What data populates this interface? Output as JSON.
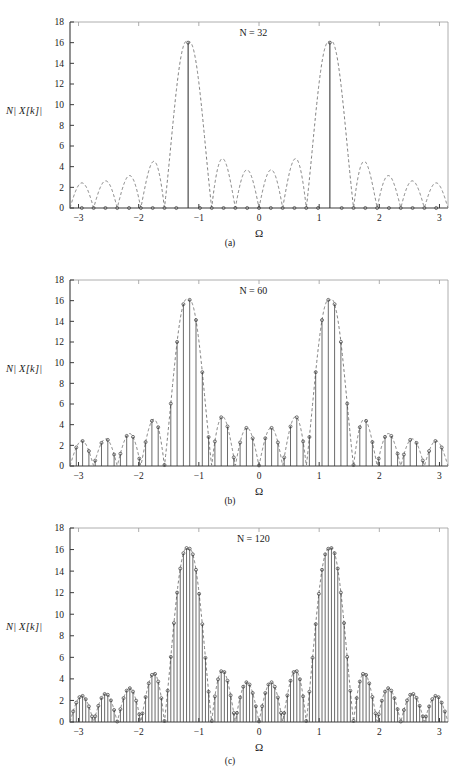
{
  "figure": {
    "panels": [
      {
        "id": "a",
        "caption": "(a)",
        "title": "N = 32",
        "ylabel": "N| X[k]|",
        "xlabel": "Ω",
        "N": 32
      },
      {
        "id": "b",
        "caption": "(b)",
        "title": "N = 60",
        "ylabel": "N| X[k]|",
        "xlabel": "Ω",
        "N": 60
      },
      {
        "id": "c",
        "caption": "(c)",
        "title": "N = 120",
        "ylabel": "N| X[k]|",
        "xlabel": "Ω",
        "N": 120
      }
    ]
  },
  "chart_data": [
    {
      "type": "line",
      "panel": "a",
      "title": "N = 32",
      "xlabel": "Ω",
      "ylabel": "N| X[k]|",
      "xlim": [
        -3.14159,
        3.14159
      ],
      "ylim": [
        0,
        18
      ],
      "xticks": [
        -3,
        -2,
        -1,
        0,
        1,
        2,
        3
      ],
      "yticks": [
        0,
        2,
        4,
        6,
        8,
        10,
        12,
        14,
        16,
        18
      ],
      "grid": false,
      "legend": "none",
      "annotations": [
        "N = 32"
      ],
      "series": [
        {
          "name": "DTFT envelope (dashed)",
          "style": "dashed",
          "description": "Magnitude of the DTFT of a 16-sample two-tone record, |sin(16Ω/2)/sin(Ω/2)| style Dirichlet kernels centred at Ω = ±1.18, mainlobe peak 16, sidelobe peaks near 3.8, 2.5, 1.9, 1.5",
          "peak_value": 16,
          "peak_x": [
            -1.18,
            1.18
          ],
          "first_sidelobe": 3.8
        },
        {
          "name": "DFT samples (stems with circle markers)",
          "style": "stem",
          "marker": "circle",
          "n_points": 32,
          "description": "32-point DFT; bins land exactly on the mainlobe peak and on nulls, so only two non-zero stems of height 16 appear at Ω = ±1.18 and all other bins are 0",
          "nonzero_samples": [
            {
              "x": -1.178,
              "y": 16.0
            },
            {
              "x": 1.178,
              "y": 16.0
            }
          ],
          "zero_samples_count": 30
        }
      ]
    },
    {
      "type": "line",
      "panel": "b",
      "title": "N = 60",
      "xlabel": "Ω",
      "ylabel": "N| X[k]|",
      "xlim": [
        -3.14159,
        3.14159
      ],
      "ylim": [
        0,
        18
      ],
      "xticks": [
        -3,
        -2,
        -1,
        0,
        1,
        2,
        3
      ],
      "yticks": [
        0,
        2,
        4,
        6,
        8,
        10,
        12,
        14,
        16,
        18
      ],
      "grid": false,
      "legend": "none",
      "annotations": [
        "N = 60"
      ],
      "series": [
        {
          "name": "DTFT envelope (dashed)",
          "style": "dashed",
          "peak_value": 16,
          "peak_x": [
            -1.18,
            1.18
          ],
          "first_sidelobe": 3.8
        },
        {
          "name": "DFT samples (stems with circle markers)",
          "style": "stem",
          "marker": "circle",
          "n_points": 60,
          "description": "60-point DFT; bins no longer align with the nulls so leakage fills in, mainlobe stems reach about 15.8 with shoulders near 12.6, 8.1 and 7.6",
          "notable_samples": [
            {
              "x": -1.26,
              "y": 12.6
            },
            {
              "x": -1.16,
              "y": 15.8
            },
            {
              "x": -1.05,
              "y": 7.6
            },
            {
              "x": 1.05,
              "y": 8.1
            },
            {
              "x": 1.16,
              "y": 15.7
            },
            {
              "x": 1.26,
              "y": 12.5
            },
            {
              "x": -1.47,
              "y": 4.0
            },
            {
              "x": 1.47,
              "y": 3.9
            },
            {
              "x": -1.88,
              "y": 2.2
            },
            {
              "x": 1.88,
              "y": 2.4
            }
          ]
        }
      ]
    },
    {
      "type": "line",
      "panel": "c",
      "title": "N = 120",
      "xlabel": "Ω",
      "ylabel": "N| X[k]|",
      "xlim": [
        -3.14159,
        3.14159
      ],
      "ylim": [
        0,
        18
      ],
      "xticks": [
        -3,
        -2,
        -1,
        0,
        1,
        2,
        3
      ],
      "yticks": [
        0,
        2,
        4,
        6,
        8,
        10,
        12,
        14,
        16,
        18
      ],
      "grid": false,
      "legend": "none",
      "annotations": [
        "N = 120"
      ],
      "series": [
        {
          "name": "DTFT envelope (dashed)",
          "style": "dashed",
          "peak_value": 16,
          "peak_x": [
            -1.18,
            1.18
          ],
          "first_sidelobe": 3.8
        },
        {
          "name": "DFT samples (stems with circle markers)",
          "style": "stem",
          "marker": "circle",
          "n_points": 120,
          "description": "120-point DFT densely samples the DTFT so the stem envelope traces the dashed curve closely",
          "notable_samples": [
            {
              "x": -1.26,
              "y": 12.4
            },
            {
              "x": -1.21,
              "y": 15.5
            },
            {
              "x": -1.16,
              "y": 15.8
            },
            {
              "x": -1.1,
              "y": 12.6
            },
            {
              "x": -1.36,
              "y": 7.1
            },
            {
              "x": -1.05,
              "y": 7.1
            },
            {
              "x": 1.05,
              "y": 7.0
            },
            {
              "x": 1.1,
              "y": 12.5
            },
            {
              "x": 1.16,
              "y": 15.8
            },
            {
              "x": 1.21,
              "y": 15.6
            },
            {
              "x": 1.26,
              "y": 12.5
            },
            {
              "x": 1.36,
              "y": 7.0
            },
            {
              "x": -1.47,
              "y": 3.8
            },
            {
              "x": 1.47,
              "y": 3.8
            }
          ]
        }
      ]
    }
  ]
}
